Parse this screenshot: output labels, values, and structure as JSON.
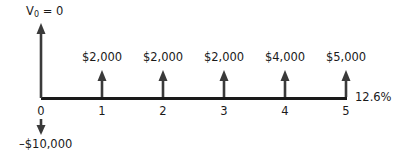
{
  "diagram": {
    "type": "cash-flow-timeline",
    "initial_value_label": {
      "symbol": "V",
      "subscript": "0",
      "equals": "= 0"
    },
    "rate_label": "12.6%",
    "periods": [
      "0",
      "1",
      "2",
      "3",
      "4",
      "5"
    ],
    "initial_outflow": "–$10,000",
    "inflows": [
      {
        "period": "1",
        "amount": "$2,000"
      },
      {
        "period": "2",
        "amount": "$2,000"
      },
      {
        "period": "3",
        "amount": "$2,000"
      },
      {
        "period": "4",
        "amount": "$4,000"
      },
      {
        "period": "5",
        "amount": "$5,000"
      }
    ],
    "colors": {
      "line": "#1a1a1a",
      "arrow": "#3a3a3a",
      "text": "#1a1a1a"
    }
  }
}
